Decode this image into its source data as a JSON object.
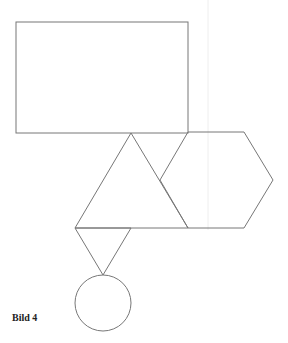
{
  "caption": "Bild 4",
  "colors": {
    "stroke": "#777777",
    "guide": "#eeeeee",
    "background": "#ffffff"
  },
  "shapes": {
    "rectangle": {
      "x": 16,
      "y": 22,
      "width": 172,
      "height": 111
    },
    "big_triangle": {
      "points": "131,133 75,228 188,228"
    },
    "hexagon": {
      "points": "188,132 244,132 273,180 244,228 188,228 160,180"
    },
    "small_triangle": {
      "points": "75,228 131,228 103,275"
    },
    "circle": {
      "cx": 103,
      "cy": 303,
      "r": 28
    },
    "guide_line": {
      "x": 208
    }
  }
}
